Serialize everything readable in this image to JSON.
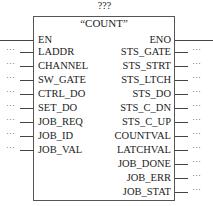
{
  "block": {
    "instance_name": "???",
    "title": "“COUNT”",
    "inputs": [
      {
        "label": "EN",
        "connection": ""
      },
      {
        "label": "LADDR",
        "connection": "…"
      },
      {
        "label": "CHANNEL",
        "connection": "…"
      },
      {
        "label": "SW_GATE",
        "connection": "…"
      },
      {
        "label": "CTRL_DO",
        "connection": "…"
      },
      {
        "label": "SET_DO",
        "connection": "…"
      },
      {
        "label": "JOB_REQ",
        "connection": "…"
      },
      {
        "label": "JOB_ID",
        "connection": "…"
      },
      {
        "label": "JOB_VAL",
        "connection": "…"
      }
    ],
    "outputs": [
      {
        "label": "ENO",
        "connection": ""
      },
      {
        "label": "STS_GATE",
        "connection": "…"
      },
      {
        "label": "STS_STRT",
        "connection": "…"
      },
      {
        "label": "STS_LTCH",
        "connection": "…"
      },
      {
        "label": "STS_DO",
        "connection": "…"
      },
      {
        "label": "STS_C_DN",
        "connection": "…"
      },
      {
        "label": "STS_C_UP",
        "connection": "…"
      },
      {
        "label": "COUNTVAL",
        "connection": "…"
      },
      {
        "label": "LATCHVAL",
        "connection": "…"
      },
      {
        "label": "JOB_DONE",
        "connection": "…"
      },
      {
        "label": "JOB_ERR",
        "connection": "…"
      },
      {
        "label": "JOB_STAT",
        "connection": "…"
      }
    ]
  }
}
